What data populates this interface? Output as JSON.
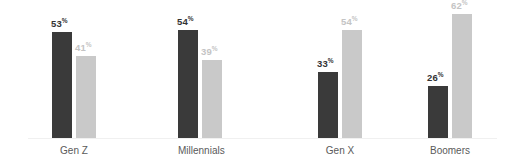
{
  "chart_data": {
    "type": "bar",
    "title": "",
    "subtitle": "",
    "xlabel": "",
    "ylabel": "",
    "ylim": [
      0,
      70
    ],
    "grid": false,
    "legend": "none",
    "value_suffix": "%",
    "categories": [
      "Gen Z",
      "Millennials",
      "Gen X",
      "Boomers"
    ],
    "series": [
      {
        "name": "series-dark",
        "color": "#3a3a3a",
        "label_color": "#333333",
        "values": [
          53,
          54,
          33,
          26
        ],
        "value_labels": [
          "53",
          "54",
          "33",
          "26"
        ]
      },
      {
        "name": "series-light",
        "color": "#c9c9c9",
        "label_color": "#c4c4c4",
        "values": [
          41,
          39,
          54,
          62
        ],
        "value_labels": [
          "41",
          "39",
          "54",
          "62"
        ]
      }
    ],
    "axis_color": "#f0f0f0",
    "category_label_color": "#5a5a5a",
    "background": "#ffffff"
  },
  "layout": {
    "group_left_px": [
      52,
      178,
      318,
      428
    ],
    "group_width_px": 44,
    "bar_width_px": 20,
    "bar_gap_px": 4,
    "baseline_y_px": 138,
    "px_per_unit": 2.0
  }
}
